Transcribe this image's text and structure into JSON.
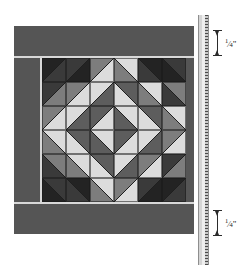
{
  "diagram": {
    "type": "quilt-block-technical-illustration",
    "colors": {
      "border_fabric": "#555555",
      "sashing_hairline": "#d8d8d8",
      "field_background": "#4a4a4a",
      "very_dark": "#232323",
      "dark": "#3a3a3a",
      "medium_dark": "#5d5d5d",
      "medium": "#7d7d7d",
      "light": "#b4b4b4",
      "very_light": "#dcdcdc",
      "ruler_body": "#d5d5d5",
      "ink": "#1a1a1a"
    },
    "callouts": [
      {
        "name": "top-seam-allowance",
        "value": "1/4",
        "numerator": "1",
        "denominator": "4",
        "unit": "\"",
        "label": "1/4\""
      },
      {
        "name": "bottom-seam-allowance",
        "value": "1/4",
        "numerator": "1",
        "denominator": "4",
        "unit": "\"",
        "label": "1/4\""
      }
    ],
    "ruler": {
      "name": "measuring-ruler",
      "orientation": "vertical",
      "tick_spacing_px": 3
    },
    "block": {
      "grid_rows": 6,
      "grid_cols": 6,
      "unit_type": "half-square-triangle",
      "pattern_name": "concentric diamonds",
      "cells": [
        [
          {
            "a": "very_dark",
            "b": "dark",
            "split": "tl-br"
          },
          {
            "a": "dark",
            "b": "very_dark",
            "split": "tl-br"
          },
          {
            "a": "medium",
            "b": "very_light",
            "split": "tl-br"
          },
          {
            "a": "very_light",
            "b": "medium",
            "split": "tr-bl"
          },
          {
            "a": "very_dark",
            "b": "dark",
            "split": "tr-bl"
          },
          {
            "a": "dark",
            "b": "very_dark",
            "split": "tr-bl"
          }
        ],
        [
          {
            "a": "dark",
            "b": "medium",
            "split": "tl-br"
          },
          {
            "a": "medium",
            "b": "very_light",
            "split": "tl-br"
          },
          {
            "a": "very_light",
            "b": "medium_dark",
            "split": "tl-br"
          },
          {
            "a": "medium_dark",
            "b": "very_light",
            "split": "tr-bl"
          },
          {
            "a": "very_light",
            "b": "medium",
            "split": "tr-bl"
          },
          {
            "a": "medium",
            "b": "dark",
            "split": "tr-bl"
          }
        ],
        [
          {
            "a": "medium",
            "b": "very_light",
            "split": "tl-br"
          },
          {
            "a": "very_light",
            "b": "medium_dark",
            "split": "tl-br"
          },
          {
            "a": "medium_dark",
            "b": "very_light",
            "split": "tl-br"
          },
          {
            "a": "very_light",
            "b": "medium_dark",
            "split": "tr-bl"
          },
          {
            "a": "medium_dark",
            "b": "very_light",
            "split": "tr-bl"
          },
          {
            "a": "very_light",
            "b": "medium",
            "split": "tr-bl"
          }
        ],
        [
          {
            "a": "medium",
            "b": "very_light",
            "split": "bl-tr"
          },
          {
            "a": "very_light",
            "b": "medium_dark",
            "split": "bl-tr"
          },
          {
            "a": "medium_dark",
            "b": "very_light",
            "split": "bl-tr"
          },
          {
            "a": "very_light",
            "b": "medium_dark",
            "split": "br-tl"
          },
          {
            "a": "medium_dark",
            "b": "very_light",
            "split": "br-tl"
          },
          {
            "a": "very_light",
            "b": "medium",
            "split": "br-tl"
          }
        ],
        [
          {
            "a": "dark",
            "b": "medium",
            "split": "bl-tr"
          },
          {
            "a": "medium",
            "b": "very_light",
            "split": "bl-tr"
          },
          {
            "a": "very_light",
            "b": "medium_dark",
            "split": "bl-tr"
          },
          {
            "a": "medium_dark",
            "b": "very_light",
            "split": "br-tl"
          },
          {
            "a": "very_light",
            "b": "medium",
            "split": "br-tl"
          },
          {
            "a": "medium",
            "b": "dark",
            "split": "br-tl"
          }
        ],
        [
          {
            "a": "very_dark",
            "b": "dark",
            "split": "bl-tr"
          },
          {
            "a": "dark",
            "b": "very_dark",
            "split": "bl-tr"
          },
          {
            "a": "medium",
            "b": "very_light",
            "split": "bl-tr"
          },
          {
            "a": "very_light",
            "b": "medium",
            "split": "br-tl"
          },
          {
            "a": "very_dark",
            "b": "dark",
            "split": "br-tl"
          },
          {
            "a": "dark",
            "b": "very_dark",
            "split": "br-tl"
          }
        ]
      ]
    }
  }
}
